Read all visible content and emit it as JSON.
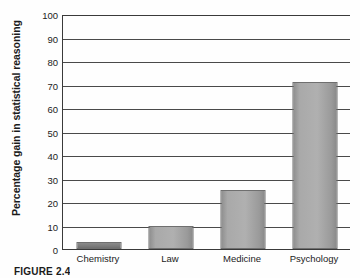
{
  "figure": {
    "caption": "FIGURE 2.4"
  },
  "chart_data": {
    "type": "bar",
    "title": "",
    "xlabel": "",
    "ylabel": "Percentage gain in statistical reasoning",
    "categories": [
      "Chemistry",
      "Law",
      "Medicine",
      "Psychology"
    ],
    "values": [
      3,
      10,
      25,
      71
    ],
    "ylim": [
      0,
      100
    ],
    "ytick_labels": [
      "0",
      "10",
      "20",
      "30",
      "40",
      "50",
      "60",
      "70",
      "80",
      "90",
      "100"
    ],
    "ytick_values": [
      0,
      10,
      20,
      30,
      40,
      50,
      60,
      70,
      80,
      90,
      100
    ],
    "grid": true,
    "legend": "none",
    "bar_color": "#a9a9a9",
    "bar_edge_color": "#6f6f6f",
    "axis_color": "#3a3a3a",
    "text_color": "#1b1b1b"
  }
}
